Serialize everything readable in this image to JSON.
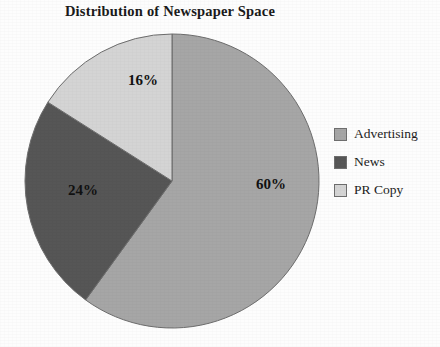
{
  "chart_data": {
    "type": "pie",
    "title": "Distribution of Newspaper Space",
    "categories": [
      "Advertising",
      "News",
      "PR Copy"
    ],
    "values": [
      60,
      24,
      16
    ],
    "value_unit": "%",
    "data_labels": [
      "60%",
      "24%",
      "16%"
    ],
    "colors": [
      "#a6a6a6",
      "#565656",
      "#d4d4d4"
    ],
    "start_angle_deg": 0,
    "direction": "clockwise",
    "legend_position": "right",
    "grid": false,
    "xlabel": "",
    "ylabel": ""
  },
  "legend": {
    "items": [
      {
        "label": "Advertising",
        "color": "#a6a6a6"
      },
      {
        "label": "News",
        "color": "#565656"
      },
      {
        "label": "PR Copy",
        "color": "#d4d4d4"
      }
    ]
  },
  "pie_geometry": {
    "center_x": 148,
    "center_y": 148,
    "radius": 147,
    "label_positions": [
      {
        "x": 247,
        "y": 156
      },
      {
        "x": 59,
        "y": 162
      },
      {
        "x": 119,
        "y": 52
      }
    ]
  }
}
